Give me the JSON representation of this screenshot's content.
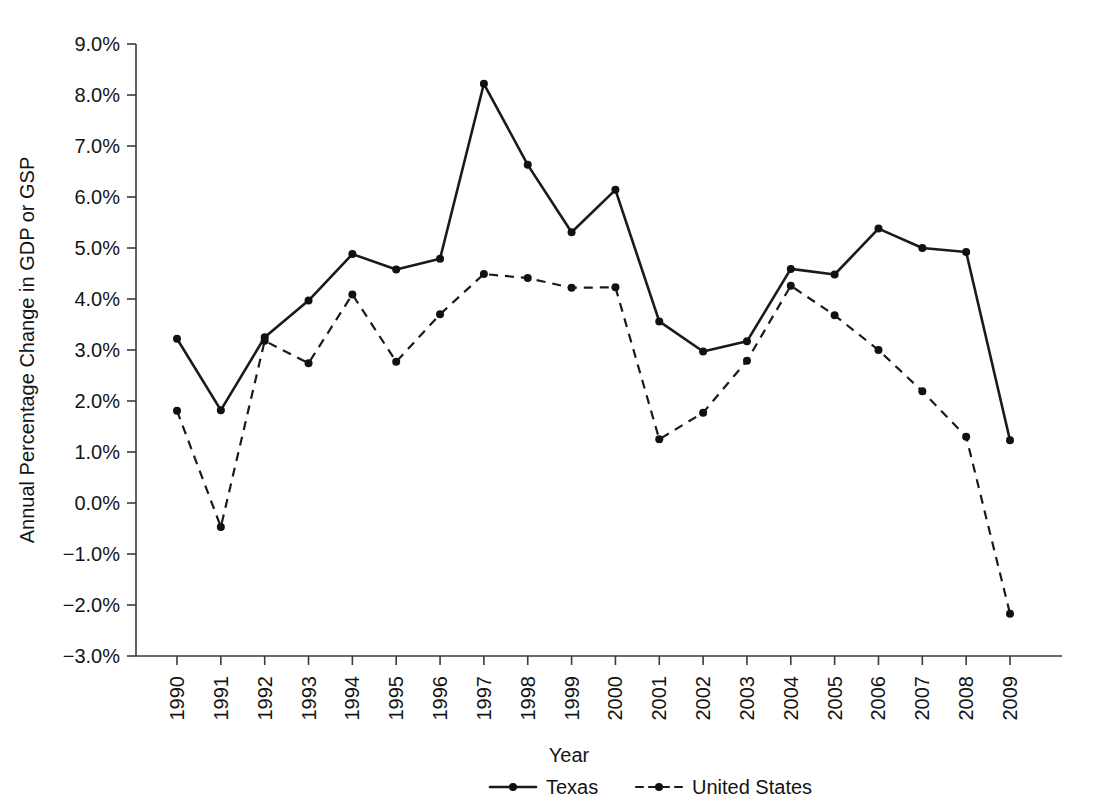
{
  "chart_data": {
    "type": "line",
    "title": "",
    "xlabel": "Year",
    "ylabel": "Annual Percentage Change in GDP or GSP",
    "xlim": [
      1990,
      2009
    ],
    "ylim": [
      -3.0,
      9.0
    ],
    "grid": false,
    "legend_position": "bottom",
    "x_tick_rotation": 90,
    "categories": [
      "1990",
      "1991",
      "1992",
      "1993",
      "1994",
      "1995",
      "1996",
      "1997",
      "1998",
      "1999",
      "2000",
      "2001",
      "2002",
      "2003",
      "2004",
      "2005",
      "2006",
      "2007",
      "2008",
      "2009"
    ],
    "ytick_labels": [
      "9.0%",
      "8.0%",
      "7.0%",
      "6.0%",
      "5.0%",
      "4.0%",
      "3.0%",
      "2.0%",
      "1.0%",
      "0.0%",
      "−1.0%",
      "−2.0%",
      "−3.0%"
    ],
    "ytick_values": [
      9.0,
      8.0,
      7.0,
      6.0,
      5.0,
      4.0,
      3.0,
      2.0,
      1.0,
      0.0,
      -1.0,
      -2.0,
      -3.0
    ],
    "series": [
      {
        "name": "Texas",
        "style": "solid",
        "marker": "circle",
        "color": "#1a1a1a",
        "values": [
          3.22,
          1.82,
          3.25,
          3.97,
          4.88,
          4.58,
          4.79,
          8.22,
          6.63,
          5.31,
          6.14,
          3.56,
          2.97,
          3.17,
          4.59,
          4.48,
          5.38,
          5.0,
          4.92,
          1.23
        ]
      },
      {
        "name": "United States",
        "style": "dashed",
        "marker": "circle",
        "color": "#1a1a1a",
        "values": [
          1.81,
          -0.47,
          3.18,
          2.74,
          4.09,
          2.77,
          3.7,
          4.49,
          4.41,
          4.22,
          4.23,
          1.25,
          1.77,
          2.79,
          4.26,
          3.68,
          3.0,
          2.19,
          1.3,
          -2.17
        ]
      }
    ]
  },
  "legend": {
    "items": [
      {
        "label": "Texas",
        "style": "solid"
      },
      {
        "label": "United States",
        "style": "dashed"
      }
    ]
  },
  "axes": {
    "x_title": "Year",
    "y_title": "Annual Percentage Change in GDP or GSP"
  }
}
